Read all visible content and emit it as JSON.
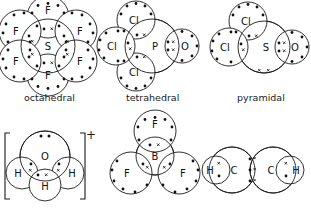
{
  "figure": {
    "style": {
      "stroke": "#1a1a1a",
      "fill": "#ffffff",
      "dot_color": "#111111",
      "background": "#ffffff"
    }
  },
  "shape_labels": [
    {
      "id": "label-octahedral",
      "text": "octahedral",
      "x": 24,
      "y": 92
    },
    {
      "id": "label-tetrahedral",
      "text": "tetrahedral",
      "x": 126,
      "y": 92
    },
    {
      "id": "label-pyramidal",
      "text": "pyramidal",
      "x": 237,
      "y": 92
    }
  ],
  "charges": [
    {
      "id": "charge-hydronium",
      "text": "+",
      "x": 86,
      "y": 134
    }
  ],
  "structures": [
    {
      "id": "sf6",
      "name": "sulfur-hexafluoride",
      "shape": "octahedral",
      "central_atom": "S",
      "ligand_atom": "F",
      "ligand_count": 6,
      "formula": "SF6",
      "atom_labels": [
        "S",
        "F",
        "F",
        "F",
        "F",
        "F",
        "F"
      ],
      "bond_pairs": 6,
      "lone_pairs_central": 0
    },
    {
      "id": "pocl3",
      "name": "phosphoryl-chloride",
      "shape": "tetrahedral",
      "central_atom": "P",
      "ligand_atoms": [
        "Cl",
        "Cl",
        "Cl",
        "O"
      ],
      "formula": "POCl3",
      "atom_labels": [
        "P",
        "Cl",
        "Cl",
        "Cl",
        "O"
      ],
      "bond_pairs": 4,
      "lone_pairs_central": 0
    },
    {
      "id": "socl2",
      "name": "thionyl-chloride",
      "shape": "pyramidal",
      "central_atom": "S",
      "ligand_atoms": [
        "Cl",
        "Cl",
        "O"
      ],
      "formula": "SOCl2",
      "atom_labels": [
        "S",
        "Cl",
        "Cl",
        "O"
      ],
      "bond_pairs": 3,
      "lone_pairs_central": 1
    },
    {
      "id": "h3o",
      "name": "hydronium-ion",
      "shape": "pyramidal",
      "central_atom": "O",
      "ligand_atoms": [
        "H",
        "H",
        "H"
      ],
      "formula": "H3O+",
      "charge": "+",
      "atom_labels": [
        "O",
        "H",
        "H",
        "H"
      ],
      "bond_pairs": 3,
      "lone_pairs_central": 1,
      "brackets": true
    },
    {
      "id": "bf3",
      "name": "boron-trifluoride",
      "shape": "trigonal-planar",
      "central_atom": "B",
      "ligand_atoms": [
        "F",
        "F",
        "F"
      ],
      "formula": "BF3",
      "atom_labels": [
        "B",
        "F",
        "F",
        "F"
      ],
      "bond_pairs": 3,
      "lone_pairs_central": 0
    },
    {
      "id": "c2h2",
      "name": "acetylene",
      "shape": "linear",
      "central_atoms": [
        "C",
        "C"
      ],
      "ligand_atoms": [
        "H",
        "H"
      ],
      "formula": "C2H2",
      "atom_labels": [
        "H",
        "C",
        "C",
        "H"
      ],
      "bond_pairs": 5,
      "triple_bond_pairs": 3,
      "lone_pairs_central": 0
    }
  ]
}
